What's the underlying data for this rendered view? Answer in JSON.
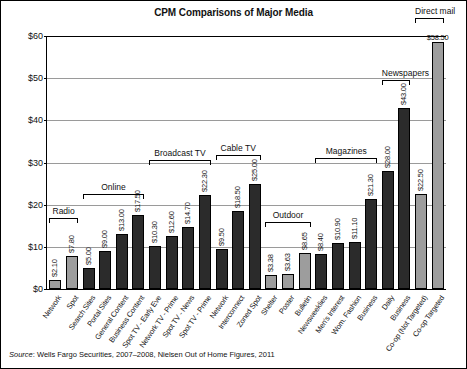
{
  "chart_data": {
    "type": "bar",
    "title": "CPM Comparisons of Major Media",
    "xlabel": "",
    "ylabel": "",
    "ylim": [
      0,
      60
    ],
    "yticks": [
      "$0",
      "$10",
      "$20",
      "$30",
      "$40",
      "$50",
      "$60"
    ],
    "ytick_values": [
      0,
      10,
      20,
      30,
      40,
      50,
      60
    ],
    "grid": true,
    "legend": "none",
    "categories": [
      "Network",
      "Spot",
      "Search Sites",
      "Portal Sites",
      "General Content",
      "Business Content",
      "Spot TV - Early Eve",
      "Network TV - Prime",
      "Spot TV - News",
      "Spot TV - Prime",
      "Network",
      "Interconnect",
      "Zoned Spot",
      "Shelter",
      "Poster",
      "Bulletin",
      "Newsweeklies",
      "Men's Interest",
      "Wom. Fashion",
      "Business",
      "Daily",
      "Business",
      "Co-op (Not Targeted)",
      "Co-op Targeted"
    ],
    "values": [
      2.1,
      7.8,
      5.0,
      9.0,
      13.0,
      17.5,
      10.3,
      12.6,
      14.7,
      22.3,
      9.5,
      18.5,
      25.0,
      3.38,
      3.63,
      8.65,
      8.4,
      10.9,
      11.1,
      21.3,
      28.0,
      43.0,
      22.5,
      58.5
    ],
    "value_labels": [
      "$2.10",
      "$7.80",
      "$5.00",
      "$9.00",
      "$13.00",
      "$17.50",
      "$10.30",
      "$12.60",
      "$14.70",
      "$22.30",
      "$9.50",
      "$18.50",
      "$25.00",
      "$3.38",
      "$3.63",
      "$8.65",
      "$8.40",
      "$10.90",
      "$11.10",
      "$21.30",
      "$28.00",
      "$43.00",
      "$22.50",
      "$58.50"
    ],
    "bar_colors": [
      "gray",
      "gray",
      "dark",
      "dark",
      "dark",
      "dark",
      "dark",
      "dark",
      "dark",
      "dark",
      "dark",
      "dark",
      "dark",
      "gray",
      "gray",
      "gray",
      "dark",
      "dark",
      "dark",
      "dark",
      "dark",
      "dark",
      "gray",
      "gray"
    ],
    "groups": [
      {
        "label": "Radio",
        "start": 0,
        "end": 1
      },
      {
        "label": "Online",
        "start": 2,
        "end": 5
      },
      {
        "label": "Broadcast TV",
        "start": 6,
        "end": 9
      },
      {
        "label": "Cable TV",
        "start": 10,
        "end": 12
      },
      {
        "label": "Outdoor",
        "start": 13,
        "end": 15
      },
      {
        "label": "Magazines",
        "start": 16,
        "end": 19
      },
      {
        "label": "Newspapers",
        "start": 20,
        "end": 21
      },
      {
        "label": "Direct mail",
        "start": 22,
        "end": 23
      }
    ],
    "group_label_y": [
      16.8,
      22.5,
      30.5,
      31.8,
      15.8,
      31.0,
      49.5,
      64.2
    ],
    "colors": {
      "dark_bar": "#2b2b2b",
      "gray_bar": "#9d9d9d",
      "gridline": "#9a9a9a",
      "axis": "#000000",
      "background": "#ffffff"
    }
  },
  "source": {
    "prefix": "Source",
    "text": ": Wells Fargo Securities, 2007–2008, Nielsen Out of Home Figures, 2011"
  }
}
